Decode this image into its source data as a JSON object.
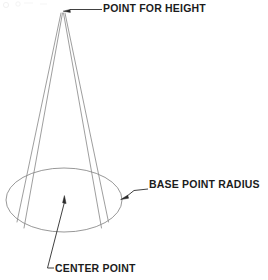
{
  "figure": {
    "kind": "technical-line-drawing",
    "background_color": "#ffffff",
    "line_color": "#8c8c8c",
    "text_color": "#1c1c1c"
  },
  "annotations": {
    "apex": {
      "label": "POINT FOR HEIGHT",
      "arrow_target_x": 63,
      "arrow_target_y": 11,
      "leader_end_x": 102,
      "leader_end_y": 9
    },
    "radius": {
      "label": "BASE POINT RADIUS",
      "arrow_target_x": 121,
      "arrow_target_y": 199,
      "leader_end_x": 148,
      "leader_end_y": 189
    },
    "center": {
      "label": "CENTER POINT",
      "arrow_target_x": 64,
      "arrow_target_y": 197,
      "leader_end_x": 54,
      "leader_end_y": 268
    }
  },
  "geometry": {
    "apex": {
      "x": 62,
      "y": 12
    },
    "base_ellipse": {
      "center_x": 64,
      "center_y": 200,
      "radius_x": 58,
      "radius_y": 32
    },
    "side_lines": [
      {
        "x1": 61.0,
        "y1": 13,
        "x2": 17.0,
        "y2": 222
      },
      {
        "x1": 62.5,
        "y1": 13,
        "x2": 24.0,
        "y2": 228
      },
      {
        "x1": 63.5,
        "y1": 13,
        "x2": 101.5,
        "y2": 228
      },
      {
        "x1": 65.0,
        "y1": 13,
        "x2": 108.5,
        "y2": 222
      }
    ]
  }
}
